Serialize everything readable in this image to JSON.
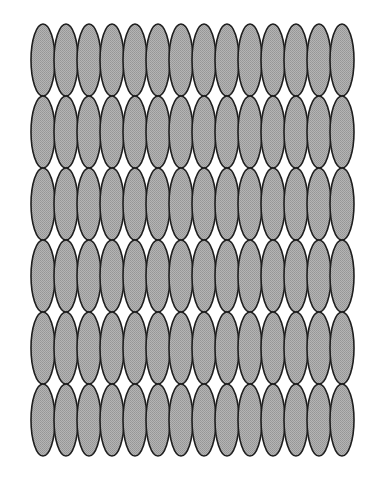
{
  "figure": {
    "rows": 6,
    "columns": 14,
    "origin_x": 31,
    "origin_y": 24,
    "pitch_x": 23,
    "pitch_y": 72,
    "ellipse_rx": 12,
    "ellipse_ry": 36,
    "colors": {
      "background": "#ffffff",
      "fill": "#a9a9a9",
      "stroke": "#1e1e1e"
    },
    "stroke_width": 1.6
  }
}
